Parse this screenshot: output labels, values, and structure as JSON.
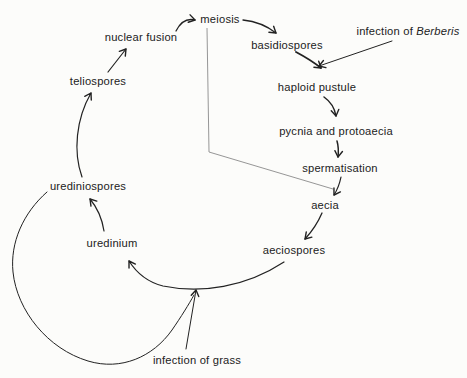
{
  "canvas": {
    "width": 467,
    "height": 378,
    "background": "#fcfcfa",
    "ink": "#222222",
    "phase_line_color": "#8a8a8a",
    "font_size": 11.2
  },
  "diagram": {
    "nodes": [
      {
        "name": "meiosis",
        "x": 220,
        "y": 23,
        "parts": [
          {
            "text": "meiosis"
          }
        ]
      },
      {
        "name": "nuclear-fusion",
        "x": 141,
        "y": 41,
        "parts": [
          {
            "text": "nuclear fusion"
          }
        ]
      },
      {
        "name": "teliospores",
        "x": 98,
        "y": 85,
        "parts": [
          {
            "text": "teliospores"
          }
        ]
      },
      {
        "name": "urediniospores",
        "x": 88,
        "y": 190,
        "parts": [
          {
            "text": "urediniospores"
          }
        ]
      },
      {
        "name": "uredinium",
        "x": 112,
        "y": 247,
        "parts": [
          {
            "text": "uredinium"
          }
        ]
      },
      {
        "name": "basidiospores",
        "x": 287,
        "y": 49,
        "parts": [
          {
            "text": "basidiospores"
          }
        ]
      },
      {
        "name": "infection-of-berberis",
        "x": 408,
        "y": 35,
        "parts": [
          {
            "text": "infection of "
          },
          {
            "text": "Berberis",
            "italic": true
          }
        ]
      },
      {
        "name": "haploid-pustule",
        "x": 317,
        "y": 91,
        "parts": [
          {
            "text": "haploid pustule"
          }
        ]
      },
      {
        "name": "pycnia-and-protoaecia",
        "x": 336,
        "y": 135,
        "parts": [
          {
            "text": "pycnia and protoaecia"
          }
        ]
      },
      {
        "name": "spermatisation",
        "x": 340,
        "y": 172,
        "parts": [
          {
            "text": "spermatisation"
          }
        ]
      },
      {
        "name": "aecia",
        "x": 325,
        "y": 209,
        "parts": [
          {
            "text": "aecia"
          }
        ]
      },
      {
        "name": "aeciospores",
        "x": 294,
        "y": 254,
        "parts": [
          {
            "text": "aeciospores"
          }
        ]
      },
      {
        "name": "infection-of-grass",
        "x": 197,
        "y": 364,
        "parts": [
          {
            "text": "infection of grass"
          }
        ]
      }
    ],
    "edges": [
      {
        "name": "teliospores-to-nuclear-fusion",
        "path": "M108,72 L126,49",
        "arrow": true,
        "width": 1.2
      },
      {
        "name": "nuclear-fusion-to-meiosis",
        "path": "M176,31 Q183,17 195,20",
        "arrow": true,
        "width": 1.3
      },
      {
        "name": "meiosis-to-basidiospores",
        "path": "M243,20 Q262,22 276,33",
        "arrow": true,
        "width": 1.3
      },
      {
        "name": "basidiospores-to-haploid-pustule",
        "path": "M296,52 Q311,60 321,68",
        "arrow": true,
        "width": 1.9
      },
      {
        "name": "infection-of-berberis-to-haploid-pustule",
        "path": "M392,41 L319,66",
        "arrow": true,
        "width": 1.0
      },
      {
        "name": "haploid-pustule-to-pycnia",
        "path": "M324,97 Q334,104 336,116",
        "arrow": true,
        "width": 1.5
      },
      {
        "name": "pycnia-to-spermatisation",
        "path": "M337,141 Q339,148 338,157",
        "arrow": true,
        "width": 1.5
      },
      {
        "name": "spermatisation-to-aecia",
        "path": "M341,177 Q339,187 334,195",
        "arrow": true,
        "width": 1.2
      },
      {
        "name": "aecia-to-aeciospores",
        "path": "M322,213 Q316,227 305,239",
        "arrow": true,
        "width": 1.3
      },
      {
        "name": "aeciospores-to-uredinium",
        "path": "M284,262 C246,287 201,294 163,286 C147,282 136,272 129,261",
        "arrow": true,
        "width": 1.2
      },
      {
        "name": "uredinium-to-urediniospores",
        "path": "M104,231 Q101,212 90,199",
        "arrow": true,
        "width": 1.2
      },
      {
        "name": "urediniospores-to-teliospores",
        "path": "M82,177 C73,152 76,119 91,93",
        "arrow": true,
        "width": 1.2
      },
      {
        "name": "uredinial-repeat-loop",
        "path": "M47,192 C23,213 10,243 13,272 C17,311 48,349 88,361 C121,371 153,357 172,330 C181,317 189,304 194,295",
        "arrow": false,
        "width": 1.0
      },
      {
        "name": "infection-of-grass-to-cycle",
        "path": "M186,349 L196,290",
        "arrow": true,
        "width": 1.0
      }
    ],
    "phase_lines": [
      {
        "name": "phase-line-vertical",
        "path": "M207,28 L209,152"
      },
      {
        "name": "phase-line-diagonal",
        "path": "M209,152 L333,189"
      }
    ]
  }
}
